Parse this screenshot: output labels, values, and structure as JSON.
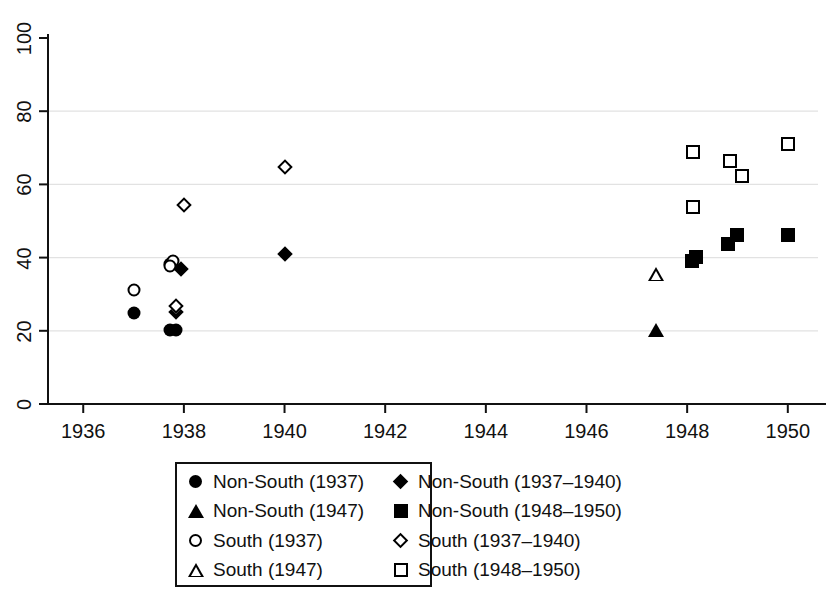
{
  "chart_data": {
    "type": "scatter",
    "title": "",
    "xlabel": "",
    "ylabel": "",
    "xlim": [
      1935.3,
      1950.6
    ],
    "ylim": [
      0,
      100
    ],
    "grid": "horizontal gridlines at 20, 40, 60, 80 (light gray)",
    "x_ticks": [
      "1936",
      "1938",
      "1940",
      "1942",
      "1944",
      "1946",
      "1948",
      "1950"
    ],
    "x_tick_values": [
      1936,
      1938,
      1940,
      1942,
      1944,
      1946,
      1948,
      1950
    ],
    "y_ticks": [
      "0",
      "20",
      "40",
      "60",
      "80",
      "100"
    ],
    "y_tick_values": [
      0,
      20,
      40,
      60,
      80,
      100
    ],
    "legend_position": "below-plot-center",
    "series": [
      {
        "name": "Non-South (1937)",
        "marker": "filled-circle",
        "points": [
          {
            "x": 1937.0,
            "y": 24.8
          },
          {
            "x": 1937.72,
            "y": 38.3
          },
          {
            "x": 1937.72,
            "y": 20.2
          },
          {
            "x": 1937.85,
            "y": 20.2
          }
        ]
      },
      {
        "name": "Non-South (1947)",
        "marker": "filled-triangle",
        "points": [
          {
            "x": 1947.38,
            "y": 20.3
          }
        ]
      },
      {
        "name": "South (1937)",
        "marker": "open-circle",
        "points": [
          {
            "x": 1937.0,
            "y": 31.2
          },
          {
            "x": 1937.78,
            "y": 39.2
          },
          {
            "x": 1937.72,
            "y": 37.6
          }
        ]
      },
      {
        "name": "South (1947)",
        "marker": "open-triangle",
        "points": [
          {
            "x": 1947.38,
            "y": 35.5
          }
        ]
      },
      {
        "name": "Non-South (1937–1940)",
        "marker": "filled-diamond",
        "points": [
          {
            "x": 1937.95,
            "y": 36.9
          },
          {
            "x": 1937.85,
            "y": 25.2
          },
          {
            "x": 1940.0,
            "y": 41.0
          }
        ]
      },
      {
        "name": "Non-South (1948–1950)",
        "marker": "filled-square",
        "points": [
          {
            "x": 1948.1,
            "y": 39.1
          },
          {
            "x": 1948.18,
            "y": 40.3
          },
          {
            "x": 1948.82,
            "y": 43.7
          },
          {
            "x": 1949.0,
            "y": 46.3
          },
          {
            "x": 1950.0,
            "y": 46.2
          }
        ]
      },
      {
        "name": "South (1937–1940)",
        "marker": "open-diamond",
        "points": [
          {
            "x": 1937.85,
            "y": 26.8
          },
          {
            "x": 1938.0,
            "y": 54.3
          },
          {
            "x": 1940.0,
            "y": 64.8
          }
        ]
      },
      {
        "name": "South (1948–1950)",
        "marker": "open-square",
        "points": [
          {
            "x": 1948.12,
            "y": 68.8
          },
          {
            "x": 1948.12,
            "y": 53.8
          },
          {
            "x": 1948.85,
            "y": 66.5
          },
          {
            "x": 1949.08,
            "y": 62.2
          },
          {
            "x": 1950.0,
            "y": 71.0
          }
        ]
      }
    ]
  },
  "legend": {
    "items": [
      {
        "label": "Non-South (1937)",
        "marker": "filled-circle"
      },
      {
        "label": "Non-South (1937–1940)",
        "marker": "filled-diamond"
      },
      {
        "label": "Non-South (1947)",
        "marker": "filled-triangle"
      },
      {
        "label": "Non-South (1948–1950)",
        "marker": "filled-square"
      },
      {
        "label": "South (1937)",
        "marker": "open-circle"
      },
      {
        "label": "South (1937–1940)",
        "marker": "open-diamond"
      },
      {
        "label": "South (1947)",
        "marker": "open-triangle"
      },
      {
        "label": "South (1948–1950)",
        "marker": "open-square"
      }
    ]
  },
  "colors": {
    "marker": "#000000",
    "axis": "#111111",
    "grid": "#e2e2e2",
    "background": "#ffffff"
  }
}
